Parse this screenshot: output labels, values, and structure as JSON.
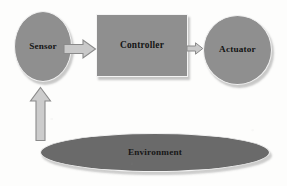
{
  "diagram": {
    "background_color": "#fdfdfc",
    "nodes": [
      {
        "id": "sensor",
        "label": "Sensor",
        "shape": "ellipse",
        "fill_color": "#8f8f8f",
        "text_color": "#141414"
      },
      {
        "id": "controller",
        "label": "Controller",
        "shape": "rectangle",
        "fill_color": "#8f8f8f",
        "text_color": "#141414"
      },
      {
        "id": "actuator",
        "label": "Actuator",
        "shape": "circle",
        "fill_color": "#8f8f8f",
        "text_color": "#141414"
      },
      {
        "id": "environment",
        "label": "Environment",
        "shape": "ellipse",
        "fill_color": "#6a6a6a",
        "text_color": "#171717"
      }
    ],
    "arrows": [
      {
        "id": "sensor-to-controller",
        "from": "sensor",
        "to": "controller",
        "direction": "right",
        "label": "",
        "fill_color": "#c9c9c9",
        "stroke_color": "#8a8a8a"
      },
      {
        "id": "controller-to-actuator",
        "from": "controller",
        "to": "actuator",
        "direction": "right",
        "label": "",
        "fill_color": "#c9c9c9",
        "stroke_color": "#8a8a8a"
      },
      {
        "id": "environment-to-sensor",
        "from": "environment",
        "to": "sensor",
        "direction": "up",
        "label": "",
        "fill_color": "#cccccc",
        "stroke_color": "#8a8a8a"
      }
    ]
  }
}
